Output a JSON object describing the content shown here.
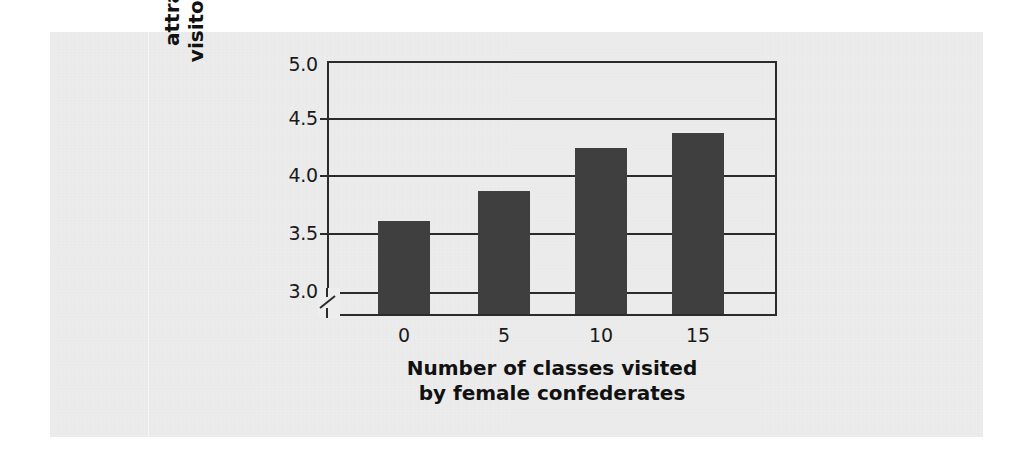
{
  "figure": {
    "background_color": "#ededed",
    "page_color": "#ffffff",
    "bar_color": "#3f3f3f",
    "axis_color": "#2b2b2b"
  },
  "chart_data": {
    "type": "bar",
    "title": "",
    "subtitle": "",
    "categories": [
      "0",
      "5",
      "10",
      "15"
    ],
    "values": [
      3.62,
      3.88,
      4.25,
      4.38
    ],
    "series": [
      {
        "name": "Rating of attractiveness of visitor's personality",
        "values": [
          3.62,
          3.88,
          4.25,
          4.38
        ]
      }
    ],
    "xlabel": "Number of classes visited by female confederates",
    "xlabel_lines": [
      "Number of classes visited",
      "by female confederates"
    ],
    "ylabel": "Rating of attractiveness of visitor's personality",
    "ylabel_lines": [
      "Rating of",
      "attractiveness of",
      "visitor's personality"
    ],
    "ylim": [
      3.0,
      5.0
    ],
    "yticks": [
      "3.0",
      "3.5",
      "4.0",
      "4.5",
      "5.0"
    ],
    "ytick_values": [
      3.0,
      3.5,
      4.0,
      4.5,
      5.0
    ],
    "xticks": [
      "0",
      "5",
      "10",
      "15"
    ],
    "grid": true,
    "grid_axis": "y",
    "legend": "none",
    "axis_break": true,
    "axis_break_note": "y-axis broken below 3.0",
    "bar_color": "#3f3f3f"
  }
}
